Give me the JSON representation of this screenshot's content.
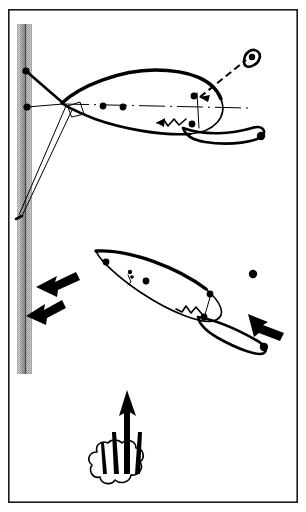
{
  "figure": {
    "background_color": "#ffffff",
    "ink_color": "#000000",
    "frame": {
      "name": "outer-border",
      "x": 8,
      "y": 9,
      "width": 290,
      "height": 494,
      "stroke_color": "#1a1a1a",
      "stroke_width": 1.6
    },
    "vertical_bar": {
      "label": "vertical-shaded-column",
      "x": 16,
      "y": 24,
      "width": 16,
      "height": 350,
      "edge_color": "#8a8a8a",
      "core_color": "#6e6e6e",
      "halftone_color": "#9a9a9a"
    },
    "upper_body": {
      "label": "upper-lifting-body",
      "nose_x": 62,
      "nose_y": 103,
      "tail_x": 262,
      "tail_y": 136,
      "chord_line": "dash-dot centerline",
      "node_count": 6
    },
    "lower_body": {
      "label": "lower-lifting-body",
      "nose_x": 96,
      "nose_y": 251,
      "tail_x": 267,
      "tail_y": 345,
      "node_count": 5
    },
    "tether": {
      "label": "dashed-tether-line",
      "from_x": 197,
      "from_y": 95,
      "to_x": 249,
      "to_y": 57,
      "style": "dashed"
    },
    "flow_arrows": [
      {
        "name": "flow-arrow-upper-left",
        "x": 38,
        "y": 288,
        "angle": -205,
        "size": 34
      },
      {
        "name": "flow-arrow-lower-left",
        "x": 28,
        "y": 312,
        "angle": -205,
        "size": 30
      },
      {
        "name": "flow-arrow-right",
        "x": 258,
        "y": 322,
        "angle": -25,
        "size": 32
      }
    ],
    "plume": {
      "label": "rising-plume-with-arrow",
      "arrow_tip_x": 127,
      "arrow_tip_y": 392,
      "arrow_base_x": 127,
      "arrow_base_y": 470,
      "streak_count": 3,
      "cloud_center_x": 124,
      "cloud_center_y": 457
    },
    "markers": {
      "bar_nodes": 2,
      "free_node_x": 253,
      "free_node_y": 274
    }
  },
  "labels": {
    "figure_caption": "",
    "annotations": []
  }
}
